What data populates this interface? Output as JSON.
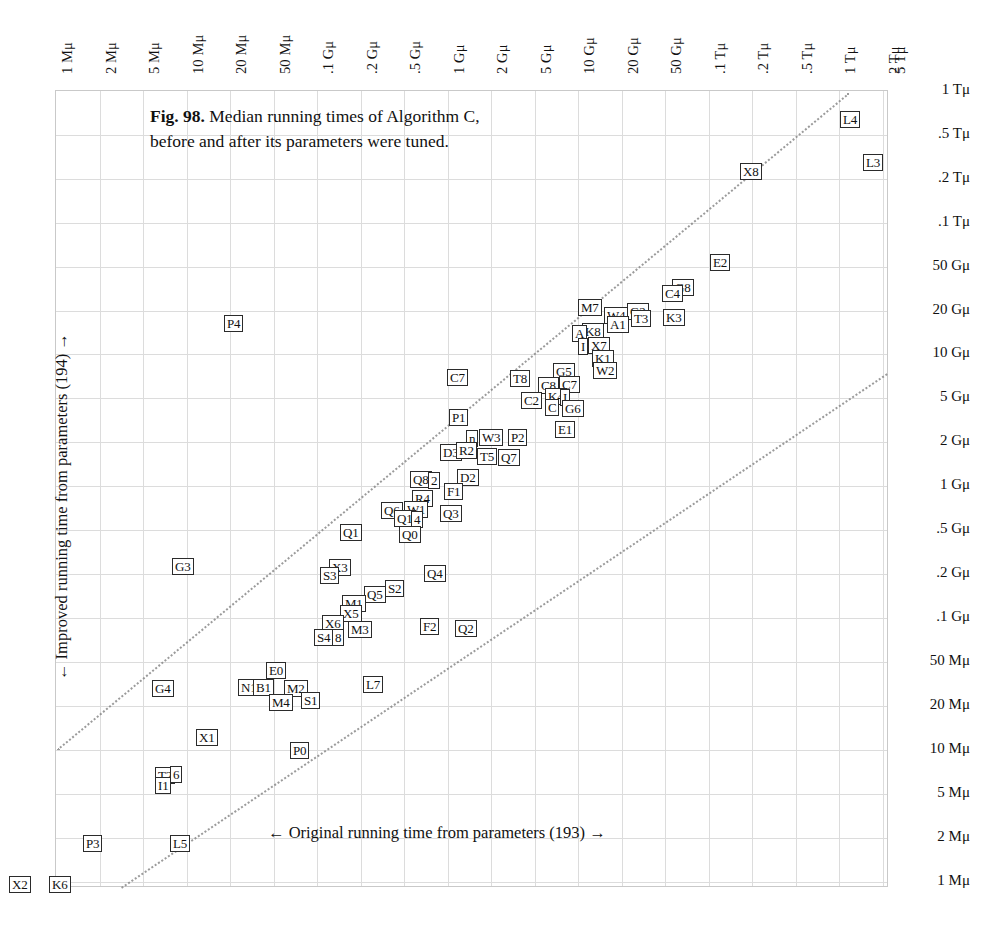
{
  "figure": {
    "caption_label": "Fig. 98.",
    "caption_text": " Median running times of Algorithm C, before and after its parameters were tuned.",
    "xlabel": "← Original running time from parameters (193) →",
    "ylabel": "← Improved running time from parameters (194) →"
  },
  "chart_data": {
    "type": "scatter",
    "title": "Fig. 98. Median running times of Algorithm C, before and after its parameters were tuned.",
    "xlabel": "← Original running time from parameters (193) →",
    "ylabel": "← Improved running time from parameters (194) →",
    "xscale": "log",
    "yscale": "log",
    "grid": true,
    "legend": false,
    "xlim": [
      "1 Mμ",
      "5 Tμ"
    ],
    "ylim": [
      "1 Mμ",
      "1 Tμ"
    ],
    "x_ticks": [
      "1 Mμ",
      "2 Mμ",
      "5 Mμ",
      "10 Mμ",
      "20 Mμ",
      "50 Mμ",
      ".1 Gμ",
      ".2 Gμ",
      ".5 Gμ",
      "1 Gμ",
      "2 Gμ",
      "5 Gμ",
      "10 Gμ",
      "20 Gμ",
      "50 Gμ",
      ".1 Tμ",
      ".2 Tμ",
      ".5 Tμ",
      "1 Tμ",
      "2 Tμ",
      "5 Tμ"
    ],
    "y_ticks": [
      "1 Tμ",
      ".5 Tμ",
      ".2 Tμ",
      ".1 Tμ",
      "50 Gμ",
      "20 Gμ",
      "10 Gμ",
      "5 Gμ",
      "2 Gμ",
      "1 Gμ",
      ".5 Gμ",
      ".2 Gμ",
      ".1 Gμ",
      "50 Mμ",
      "20 Mμ",
      "10 Mμ",
      "5 Mμ",
      "2 Mμ",
      "1 Mμ"
    ],
    "reference_lines": [
      {
        "style": "dotted",
        "note": "upper diagonal"
      },
      {
        "style": "dotted",
        "note": "lower diagonal"
      }
    ],
    "points": [
      {
        "label": "L4",
        "x": 840,
        "y": 119
      },
      {
        "label": "L3",
        "x": 863,
        "y": 162
      },
      {
        "label": "X8",
        "y": 171,
        "x": 740
      },
      {
        "label": "E2",
        "x": 710,
        "y": 262
      },
      {
        "label": "G8",
        "x": 672,
        "y": 287
      },
      {
        "label": "C4",
        "x": 662,
        "y": 293
      },
      {
        "label": "M7",
        "x": 578,
        "y": 307
      },
      {
        "label": "W4",
        "x": 604,
        "y": 315
      },
      {
        "label": "G2",
        "x": 627,
        "y": 311
      },
      {
        "label": "T3",
        "x": 631,
        "y": 318
      },
      {
        "label": "K3",
        "x": 663,
        "y": 317
      },
      {
        "label": "A1",
        "x": 607,
        "y": 324
      },
      {
        "label": "K8",
        "x": 582,
        "y": 331
      },
      {
        "label": "A",
        "x": 572,
        "y": 333
      },
      {
        "label": "X7",
        "x": 588,
        "y": 345
      },
      {
        "label": "I",
        "x": 578,
        "y": 346
      },
      {
        "label": "K1",
        "x": 592,
        "y": 358
      },
      {
        "label": "W2",
        "x": 593,
        "y": 370
      },
      {
        "label": "C7",
        "x": 447,
        "y": 377
      },
      {
        "label": "T8",
        "x": 510,
        "y": 378
      },
      {
        "label": "G5",
        "x": 553,
        "y": 371
      },
      {
        "label": "C8",
        "x": 538,
        "y": 385
      },
      {
        "label": "C7b",
        "x": 559,
        "y": 384
      },
      {
        "label": "C2",
        "x": 521,
        "y": 400
      },
      {
        "label": "K4",
        "x": 545,
        "y": 396
      },
      {
        "label": "I",
        "x": 560,
        "y": 397
      },
      {
        "label": "C",
        "x": 545,
        "y": 407
      },
      {
        "label": "G6",
        "x": 562,
        "y": 408
      },
      {
        "label": "P1",
        "x": 449,
        "y": 417
      },
      {
        "label": "E1",
        "x": 555,
        "y": 429
      },
      {
        "label": "W3",
        "x": 479,
        "y": 437
      },
      {
        "label": "P2",
        "x": 508,
        "y": 437
      },
      {
        "label": "n",
        "x": 466,
        "y": 438
      },
      {
        "label": "D3",
        "x": 440,
        "y": 452
      },
      {
        "label": "R2",
        "x": 456,
        "y": 450
      },
      {
        "label": "T5",
        "x": 477,
        "y": 456
      },
      {
        "label": "Q7",
        "x": 498,
        "y": 457
      },
      {
        "label": "D2",
        "x": 457,
        "y": 477
      },
      {
        "label": "Q8",
        "x": 410,
        "y": 479
      },
      {
        "label": "2",
        "x": 428,
        "y": 480
      },
      {
        "label": "F1",
        "x": 444,
        "y": 491
      },
      {
        "label": "R4",
        "x": 412,
        "y": 498
      },
      {
        "label": "Q6",
        "x": 381,
        "y": 510
      },
      {
        "label": "W1",
        "x": 404,
        "y": 509
      },
      {
        "label": "Q1b",
        "x": 394,
        "y": 518
      },
      {
        "label": "4",
        "x": 411,
        "y": 519
      },
      {
        "label": "Q3",
        "x": 440,
        "y": 513
      },
      {
        "label": "Q1",
        "x": 340,
        "y": 532
      },
      {
        "label": "Q0",
        "x": 399,
        "y": 534
      },
      {
        "label": "G3",
        "x": 172,
        "y": 566
      },
      {
        "label": "X3",
        "x": 329,
        "y": 567
      },
      {
        "label": "S3",
        "x": 320,
        "y": 575
      },
      {
        "label": "Q4",
        "x": 424,
        "y": 573
      },
      {
        "label": "S2",
        "x": 385,
        "y": 588
      },
      {
        "label": "Q5",
        "x": 364,
        "y": 594
      },
      {
        "label": "M1",
        "x": 342,
        "y": 603
      },
      {
        "label": "X5",
        "x": 340,
        "y": 613
      },
      {
        "label": "X6",
        "x": 322,
        "y": 623
      },
      {
        "label": "M3",
        "x": 348,
        "y": 629
      },
      {
        "label": "F2",
        "x": 420,
        "y": 626
      },
      {
        "label": "Q2",
        "x": 455,
        "y": 628
      },
      {
        "label": "S4",
        "x": 314,
        "y": 637
      },
      {
        "label": "8",
        "x": 332,
        "y": 637
      },
      {
        "label": "P4",
        "x": 224,
        "y": 323
      },
      {
        "label": "E0",
        "x": 266,
        "y": 670
      },
      {
        "label": "G4",
        "x": 152,
        "y": 688
      },
      {
        "label": "N1",
        "x": 238,
        "y": 687
      },
      {
        "label": "B1",
        "x": 253,
        "y": 687
      },
      {
        "label": "M2",
        "x": 284,
        "y": 688
      },
      {
        "label": "M4",
        "x": 269,
        "y": 702
      },
      {
        "label": "S1",
        "x": 301,
        "y": 700
      },
      {
        "label": "L7",
        "x": 363,
        "y": 684
      },
      {
        "label": "X1",
        "x": 196,
        "y": 737
      },
      {
        "label": "P0",
        "x": 290,
        "y": 750
      },
      {
        "label": "T2",
        "x": 155,
        "y": 775
      },
      {
        "label": "6",
        "x": 170,
        "y": 774
      },
      {
        "label": "I1",
        "x": 155,
        "y": 785
      },
      {
        "label": "P3",
        "x": 83,
        "y": 843
      },
      {
        "label": "L5",
        "x": 170,
        "y": 843
      },
      {
        "label": "X2",
        "x": 9,
        "y": 884
      },
      {
        "label": "K6",
        "x": 49,
        "y": 884
      }
    ]
  },
  "x_tick_positions": [
    55,
    99,
    142,
    186,
    229,
    273,
    316,
    360,
    403,
    447,
    490,
    534,
    577,
    621,
    664,
    708,
    751,
    795,
    838,
    882,
    888
  ],
  "y_tick_positions": [
    90,
    134,
    178,
    222,
    266,
    310,
    353,
    397,
    441,
    485,
    529,
    573,
    617,
    661,
    705,
    749,
    793,
    837,
    881
  ]
}
